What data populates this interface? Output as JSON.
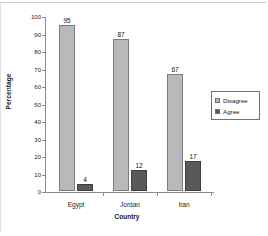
{
  "chart_data": {
    "type": "bar",
    "title": "",
    "subtitle": "",
    "xlabel": "Country",
    "ylabel": "Percentage",
    "categories": [
      "Egypt",
      "Jordan",
      "Iran"
    ],
    "series": [
      {
        "name": "Disagree",
        "values": [
          95,
          87,
          67
        ],
        "color": "#b9b9b9"
      },
      {
        "name": "Agree",
        "values": [
          4,
          12,
          17
        ],
        "color": "#595959"
      }
    ],
    "ylim": [
      0,
      100
    ],
    "ytick_step": 10,
    "yticks": [
      100,
      90,
      80,
      70,
      60,
      50,
      40,
      30,
      20,
      10,
      0
    ],
    "ytick_labels": [
      "100",
      "90",
      "80",
      "70",
      "60",
      "50",
      "40",
      "30",
      "20",
      "10",
      "0"
    ],
    "data_labels": [
      "95",
      "4",
      "87",
      "12",
      "67",
      "17"
    ],
    "grid": false,
    "legend_position": "right",
    "legend_entries": [
      "Disagree",
      "Agree"
    ]
  },
  "legend": {
    "items": [
      {
        "label": "Disagree"
      },
      {
        "label": "Agree"
      }
    ]
  },
  "axes": {
    "y_title": "Percentage",
    "x_title": "Country"
  }
}
